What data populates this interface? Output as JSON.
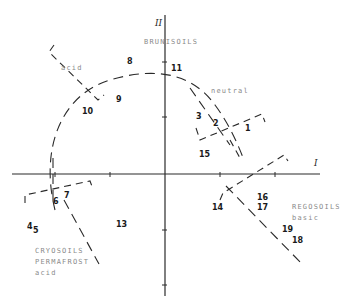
{
  "diagram": {
    "axes": {
      "horizontal_label": "I",
      "vertical_label": "II"
    },
    "zones": [
      {
        "id": "bruni",
        "lines": [
          "BRUNISOILS"
        ]
      },
      {
        "id": "acid_top",
        "lines": [
          "acid"
        ]
      },
      {
        "id": "neutral",
        "lines": [
          "neutral"
        ]
      },
      {
        "id": "rego",
        "lines": [
          "REGOSOILS",
          "basic"
        ]
      },
      {
        "id": "cryo",
        "lines": [
          "CRYOSOILS",
          "PERMAFROST",
          "acid"
        ]
      }
    ],
    "points": [
      {
        "label": "1"
      },
      {
        "label": "2"
      },
      {
        "label": "3"
      },
      {
        "label": "4"
      },
      {
        "label": "5"
      },
      {
        "label": "6"
      },
      {
        "label": "7"
      },
      {
        "label": "8"
      },
      {
        "label": "9"
      },
      {
        "label": "10"
      },
      {
        "label": "11"
      },
      {
        "label": "13"
      },
      {
        "label": "14"
      },
      {
        "label": "15"
      },
      {
        "label": "16"
      },
      {
        "label": "17"
      },
      {
        "label": "18"
      },
      {
        "label": "19"
      }
    ]
  }
}
